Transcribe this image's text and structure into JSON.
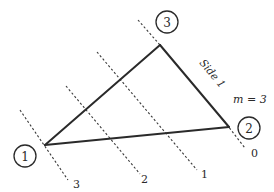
{
  "diagram": {
    "title": "",
    "colors": {
      "ink": "#2a2a2a",
      "background": "#ffffff"
    },
    "nodes": [
      {
        "id": "1",
        "label": "1",
        "vertex": [
          45,
          145
        ],
        "circle": [
          25,
          156
        ]
      },
      {
        "id": "2",
        "label": "2",
        "vertex": [
          229,
          127
        ],
        "circle": [
          249,
          128
        ]
      },
      {
        "id": "3",
        "label": "3",
        "vertex": [
          160,
          45
        ],
        "circle": [
          167,
          22
        ]
      }
    ],
    "edges": [
      {
        "from": "1",
        "to": "3"
      },
      {
        "from": "3",
        "to": "2",
        "label": "Side 1"
      },
      {
        "from": "1",
        "to": "2"
      }
    ],
    "level_lines": [
      {
        "label": "0",
        "from": [
          224,
          121
        ],
        "to": [
          245,
          148
        ],
        "label_pos": [
          251,
          155
        ]
      },
      {
        "label": "1",
        "from": [
          97,
          52
        ],
        "to": [
          197,
          170
        ],
        "label_pos": [
          203,
          176
        ]
      },
      {
        "label": "2",
        "from": [
          66,
          86
        ],
        "to": [
          140,
          174
        ],
        "label_pos": [
          144,
          181
        ]
      },
      {
        "label": "3",
        "from": [
          20,
          110
        ],
        "to": [
          68,
          180
        ],
        "label_pos": [
          73,
          186
        ]
      },
      {
        "label": "",
        "from": [
          138,
          20
        ],
        "to": [
          160,
          45
        ]
      }
    ],
    "side_label": "Side 1",
    "annotation": "m = 3"
  }
}
